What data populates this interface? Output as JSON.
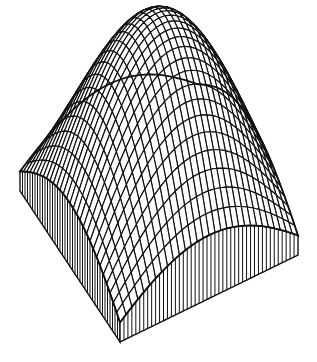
{
  "chart_data": {
    "type": "surface",
    "title": "",
    "xlabel": "",
    "ylabel": "",
    "zlabel": "",
    "style": "wireframe with hatched side walls",
    "function": "z = sin(pi*u) * sin(pi*v)",
    "domain": {
      "u": [
        0.1,
        0.9
      ],
      "v": [
        0.1,
        0.9
      ]
    },
    "grid_lines": {
      "u": 30,
      "v": 30
    },
    "z_range": [
      0.0955,
      1.0
    ],
    "peak": {
      "u": 0.5,
      "v": 0.5,
      "z": 1.0
    },
    "axes_visible": false,
    "grid_visible": false,
    "legend": null,
    "projection_px": {
      "front_corner": [
        120,
        342
      ],
      "left_corner": [
        20,
        191
      ],
      "right_corner": [
        298,
        255
      ],
      "z_scale": 205
    },
    "wall_hatch_count": {
      "left_wall": 40,
      "right_wall": 45
    },
    "colors": {
      "line": "#111111",
      "fill": "#ffffff",
      "background": "#ffffff"
    }
  }
}
